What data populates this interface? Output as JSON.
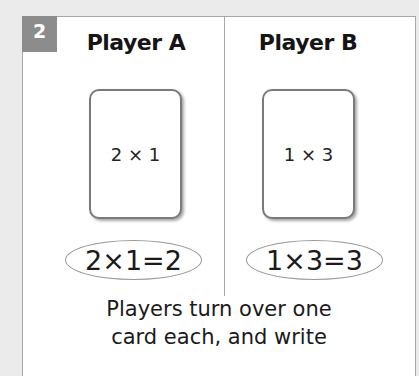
{
  "step": {
    "number": "2",
    "badge_color": "#8c8c8c"
  },
  "players": [
    {
      "name": "Player A",
      "card": "2 × 1",
      "equation": "2×1=2"
    },
    {
      "name": "Player B",
      "card": "1 × 3",
      "equation": "1×3=3"
    }
  ],
  "instructions": {
    "line1": "Players turn over one",
    "line2": "card each, and write"
  }
}
